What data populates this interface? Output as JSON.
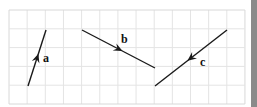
{
  "diagram": {
    "grid": {
      "x0": 9,
      "y0": 10,
      "cols": 13,
      "rows": 5,
      "cell_w": 18.15,
      "cell_h": 18.8,
      "line_color": "#e4e4e4",
      "border_color": "#d8d8d8"
    },
    "line_color": "#1a1a1a",
    "vectors": [
      {
        "label": "a",
        "x1": 28,
        "y1": 86,
        "x2": 46,
        "y2": 30,
        "arrow_at": 0.5,
        "direction": "up",
        "label_x": 43,
        "label_y": 62
      },
      {
        "label": "b",
        "x1": 82,
        "y1": 30,
        "x2": 155,
        "y2": 68,
        "arrow_at": 0.5,
        "direction": "down-right",
        "label_x": 121,
        "label_y": 43
      },
      {
        "label": "c",
        "x1": 227,
        "y1": 30,
        "x2": 155,
        "y2": 86,
        "arrow_at": 0.5,
        "direction": "down-left",
        "label_x": 200,
        "label_y": 66
      }
    ]
  },
  "edge_bar": {
    "color": "#8a8a8a"
  }
}
